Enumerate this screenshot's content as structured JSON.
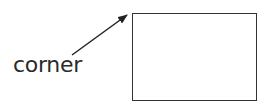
{
  "diagram": {
    "label": "corner",
    "arrow": {
      "from": [
        72,
        55
      ],
      "to": [
        128,
        15
      ],
      "color": "#222222"
    },
    "rectangle": {
      "x": 132,
      "y": 13,
      "width": 125,
      "height": 88,
      "stroke": "#333333"
    }
  }
}
